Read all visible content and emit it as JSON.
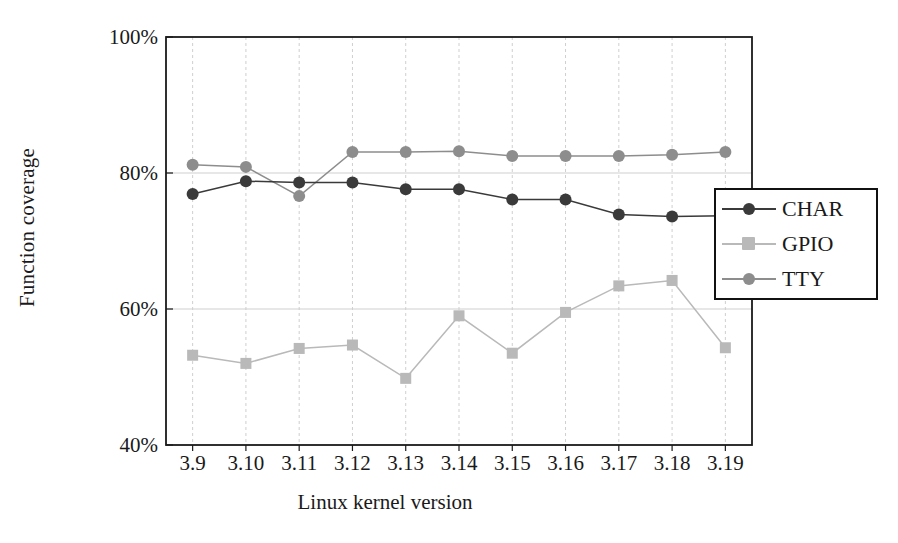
{
  "chart_data": {
    "type": "line",
    "title": "",
    "xlabel": "Linux kernel version",
    "ylabel": "Function coverage",
    "categories": [
      "3.9",
      "3.10",
      "3.11",
      "3.12",
      "3.13",
      "3.14",
      "3.15",
      "3.16",
      "3.17",
      "3.18",
      "3.19"
    ],
    "ylim": [
      40,
      100
    ],
    "yticks": [
      "40%",
      "60%",
      "80%",
      "100%"
    ],
    "ytick_values": [
      40,
      60,
      80,
      100
    ],
    "grid": true,
    "legend_position": "right",
    "series": [
      {
        "name": "CHAR",
        "color": "#3a3a3a",
        "marker": "circle",
        "values": [
          76.9,
          78.8,
          78.6,
          78.6,
          77.6,
          77.6,
          76.1,
          76.1,
          73.9,
          73.6,
          73.7
        ]
      },
      {
        "name": "GPIO",
        "color": "#b9b9b9",
        "marker": "square",
        "values": [
          53.2,
          52.0,
          54.2,
          54.7,
          49.8,
          59.0,
          53.5,
          59.5,
          63.4,
          64.2,
          54.3
        ]
      },
      {
        "name": "TTY",
        "color": "#8d8d8d",
        "marker": "circle",
        "values": [
          81.2,
          80.9,
          76.6,
          83.1,
          83.1,
          83.2,
          82.5,
          82.5,
          82.5,
          82.7,
          83.1
        ]
      }
    ]
  },
  "colors": {
    "axis": "#1a1a1a",
    "grid": "#cfcfcf",
    "background": "#ffffff"
  }
}
